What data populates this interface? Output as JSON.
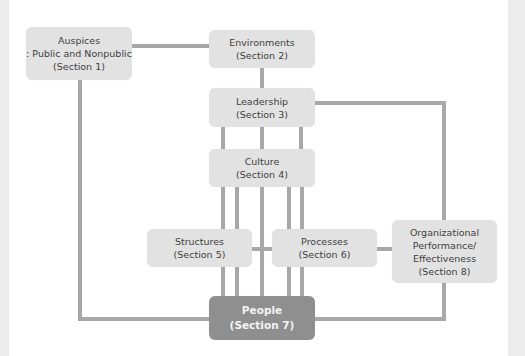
{
  "diagram": {
    "colors": {
      "box_fill": "#e2e2e2",
      "people_fill": "#8f8f8f",
      "connector": "#a8a8a8",
      "text": "#3e3e3e",
      "people_text": "#f4f4f4"
    },
    "nodes": {
      "auspices": {
        "line1": "Auspices",
        "line2": ": Public and Nonpublic",
        "line3": "(Section 1)"
      },
      "environments": {
        "line1": "Environments",
        "line2": "(Section 2)"
      },
      "leadership": {
        "line1": "Leadership",
        "line2": "(Section 3)"
      },
      "culture": {
        "line1": "Culture",
        "line2": "(Section 4)"
      },
      "structures": {
        "line1": "Structures",
        "line2": "(Section 5)"
      },
      "processes": {
        "line1": "Processes",
        "line2": "(Section 6)"
      },
      "people": {
        "line1": "People",
        "line2": "(Section 7)"
      },
      "performance": {
        "line1": "Organizational",
        "line2": "Performance/",
        "line3": "Effectiveness",
        "line4": "(Section 8)"
      }
    }
  }
}
